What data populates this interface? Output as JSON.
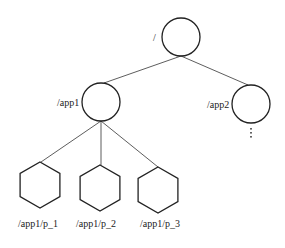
{
  "diagram": {
    "type": "tree",
    "colors": {
      "stroke": "#222222",
      "edge": "#333333",
      "background": "#ffffff"
    },
    "nodes": [
      {
        "id": "root",
        "label": "/",
        "shape": "circle",
        "cx": 181,
        "cy": 37,
        "r": 19,
        "label_x": 153,
        "label_y": 41,
        "label_anchor": "start"
      },
      {
        "id": "app1",
        "label": "/app1",
        "shape": "circle",
        "cx": 101,
        "cy": 102,
        "r": 19,
        "label_x": 57,
        "label_y": 106,
        "label_anchor": "start"
      },
      {
        "id": "app2",
        "label": "/app2",
        "shape": "circle",
        "cx": 251,
        "cy": 104,
        "r": 19,
        "label_x": 207,
        "label_y": 108,
        "label_anchor": "start"
      },
      {
        "id": "p1",
        "label": "/app1/p_1",
        "shape": "hexagon",
        "cx": 40,
        "cy": 185,
        "r": 23,
        "label_x": 18,
        "label_y": 227,
        "label_anchor": "start"
      },
      {
        "id": "p2",
        "label": "/app1/p_2",
        "shape": "hexagon",
        "cx": 100,
        "cy": 188,
        "r": 23,
        "label_x": 76,
        "label_y": 227,
        "label_anchor": "start"
      },
      {
        "id": "p3",
        "label": "/app1/p_3",
        "shape": "hexagon",
        "cx": 158,
        "cy": 190,
        "r": 23,
        "label_x": 140,
        "label_y": 227,
        "label_anchor": "start"
      }
    ],
    "edges": [
      {
        "from": "root",
        "to": "app1",
        "x1": 181,
        "y1": 56,
        "x2": 104,
        "y2": 83
      },
      {
        "from": "root",
        "to": "app2",
        "x1": 181,
        "y1": 56,
        "x2": 248,
        "y2": 85
      },
      {
        "from": "app1",
        "to": "p1",
        "x1": 101,
        "y1": 121,
        "x2": 41,
        "y2": 162
      },
      {
        "from": "app1",
        "to": "p2",
        "x1": 101,
        "y1": 121,
        "x2": 101,
        "y2": 165
      },
      {
        "from": "app1",
        "to": "p3",
        "x1": 101,
        "y1": 121,
        "x2": 158,
        "y2": 167
      }
    ],
    "continuation": {
      "label": "⋮",
      "near": "app2",
      "x": 251,
      "y": 128
    }
  }
}
